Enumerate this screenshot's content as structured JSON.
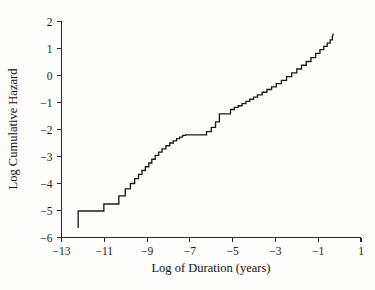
{
  "chart_data": {
    "type": "line",
    "title": "",
    "xlabel": "Log of Duration (years)",
    "ylabel": "Log Cumulative Hazard",
    "xlim": [
      -13,
      1
    ],
    "ylim": [
      -6,
      2
    ],
    "xticks": [
      -13,
      -11,
      -9,
      -7,
      -5,
      -3,
      -1,
      1
    ],
    "xticklabels": [
      "−13",
      "−11",
      "−9",
      "−7",
      "−5",
      "−3",
      "−1",
      "1"
    ],
    "yticks": [
      2,
      1,
      0,
      -1,
      -2,
      -3,
      -4,
      -5,
      -6
    ],
    "yticklabels": [
      "2",
      "1",
      "0",
      "−1",
      "−2",
      "−3",
      "−4",
      "−5",
      "−6"
    ],
    "grid": false,
    "legend": null,
    "series": [
      {
        "name": "Log cumulative hazard (step curve)",
        "style": "step-post",
        "color": "#1c1c1c",
        "x": [
          -12.22,
          -12.22,
          -11.02,
          -11.02,
          -10.32,
          -10.32,
          -10.02,
          -10.02,
          -9.78,
          -9.78,
          -9.58,
          -9.58,
          -9.4,
          -9.4,
          -9.24,
          -9.24,
          -9.08,
          -9.08,
          -8.92,
          -8.92,
          -8.78,
          -8.78,
          -8.62,
          -8.62,
          -8.46,
          -8.46,
          -8.3,
          -8.3,
          -8.12,
          -8.12,
          -7.94,
          -7.94,
          -7.78,
          -7.78,
          -7.62,
          -7.62,
          -7.48,
          -7.48,
          -7.34,
          -7.34,
          -7.2,
          -7.2,
          -6.22,
          -6.22,
          -6.0,
          -6.0,
          -5.8,
          -5.8,
          -5.62,
          -5.62,
          -5.1,
          -5.1,
          -4.92,
          -4.92,
          -4.74,
          -4.74,
          -4.56,
          -4.56,
          -4.38,
          -4.38,
          -4.2,
          -4.2,
          -4.02,
          -4.02,
          -3.84,
          -3.84,
          -3.62,
          -3.62,
          -3.4,
          -3.4,
          -3.18,
          -3.18,
          -2.96,
          -2.96,
          -2.72,
          -2.72,
          -2.48,
          -2.48,
          -2.24,
          -2.24,
          -2.0,
          -2.0,
          -1.78,
          -1.78,
          -1.56,
          -1.56,
          -1.34,
          -1.34,
          -1.12,
          -1.12,
          -0.92,
          -0.92,
          -0.74,
          -0.74,
          -0.58,
          -0.58,
          -0.44,
          -0.44,
          -0.34,
          -0.34,
          -0.3
        ],
        "y": [
          -5.65,
          -5.02,
          -5.02,
          -4.76,
          -4.76,
          -4.46,
          -4.46,
          -4.2,
          -4.2,
          -4.0,
          -4.0,
          -3.82,
          -3.82,
          -3.66,
          -3.66,
          -3.52,
          -3.52,
          -3.38,
          -3.38,
          -3.24,
          -3.24,
          -3.1,
          -3.1,
          -2.96,
          -2.96,
          -2.84,
          -2.84,
          -2.72,
          -2.72,
          -2.6,
          -2.6,
          -2.5,
          -2.5,
          -2.42,
          -2.42,
          -2.34,
          -2.34,
          -2.28,
          -2.28,
          -2.22,
          -2.22,
          -2.2,
          -2.2,
          -2.08,
          -2.08,
          -1.92,
          -1.92,
          -1.72,
          -1.72,
          -1.42,
          -1.42,
          -1.26,
          -1.26,
          -1.18,
          -1.18,
          -1.12,
          -1.12,
          -1.04,
          -1.04,
          -0.96,
          -0.96,
          -0.88,
          -0.88,
          -0.8,
          -0.8,
          -0.72,
          -0.72,
          -0.62,
          -0.62,
          -0.52,
          -0.52,
          -0.42,
          -0.42,
          -0.3,
          -0.3,
          -0.18,
          -0.18,
          -0.04,
          -0.04,
          0.1,
          0.1,
          0.24,
          0.24,
          0.38,
          0.38,
          0.52,
          0.52,
          0.66,
          0.66,
          0.82,
          0.82,
          0.96,
          0.96,
          1.08,
          1.08,
          1.2,
          1.2,
          1.32,
          1.32,
          1.42,
          1.55
        ]
      }
    ]
  },
  "axes": {
    "y_axis_title": "Log Cumulative Hazard",
    "x_axis_title": "Log of Duration (years)"
  }
}
